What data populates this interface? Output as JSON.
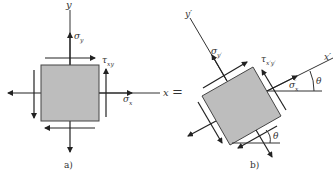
{
  "panel_a": {
    "caption": "a)",
    "axis_x_label": "x",
    "axis_y_label": "y",
    "normal_stress_x": "σ",
    "normal_stress_x_sub": "x",
    "normal_stress_y": "σ",
    "normal_stress_y_sub": "y",
    "shear_stress": "τ",
    "shear_stress_sub": "xy"
  },
  "equals_sign": "=",
  "panel_b": {
    "caption": "b)",
    "axis_x_label": "x′",
    "axis_y_label": "y′",
    "normal_stress_x": "σ",
    "normal_stress_x_sub": "x",
    "normal_stress_x_sup": "′",
    "normal_stress_y": "σ",
    "normal_stress_y_sub": "y′",
    "shear_stress": "τ",
    "shear_stress_sub": "x′y′",
    "angle_label_1": "θ",
    "angle_label_2": "θ"
  },
  "colors": {
    "element_fill": "#bdbdbd",
    "line": "#333333",
    "background": "#ffffff"
  }
}
